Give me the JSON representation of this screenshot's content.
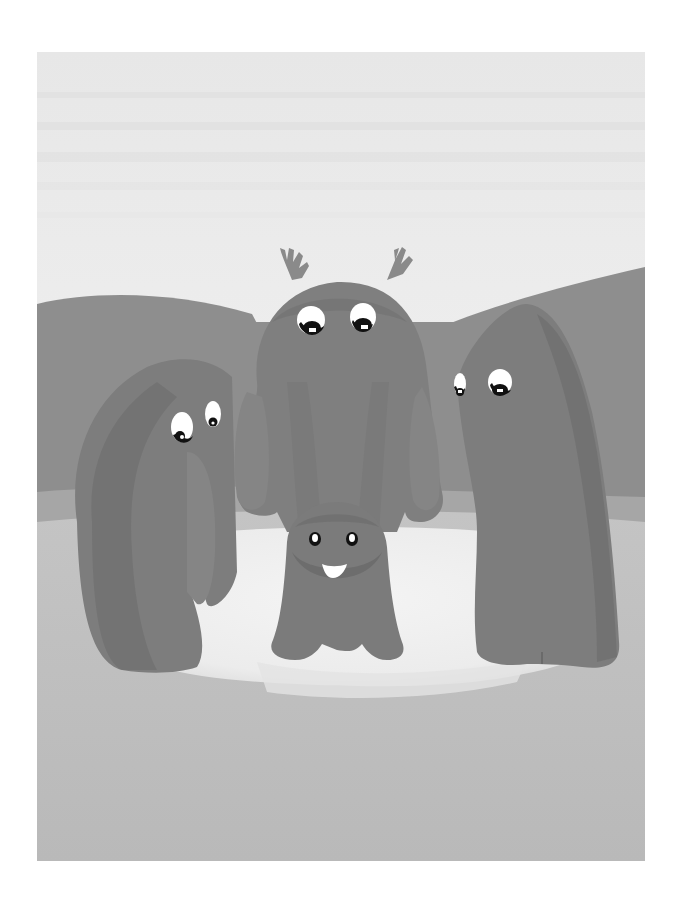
{
  "illustration": {
    "subject": "Four furry monster creatures standing around a pale pond in front of hills",
    "characters": [
      {
        "name": "left-creature",
        "pose": "leaning forward, looking down"
      },
      {
        "name": "tall-center-creature",
        "pose": "standing with antler-like tufts, looking down"
      },
      {
        "name": "right-creature",
        "pose": "leaning, looking down-left"
      },
      {
        "name": "small-smiling-creature",
        "pose": "standing in front, smiling"
      }
    ],
    "colors": {
      "sky": "#ececec",
      "sky_stripe": "#e2e2e2",
      "hills": "#8c8c8c",
      "creature": "#7e7e7e",
      "creature_shade": "#737373",
      "creature_light": "#8a8a8a",
      "pond": "#eeeeee",
      "ground": "#bdbdbd",
      "ground_mid": "#cacaca",
      "eye_white": "#ffffff",
      "pupil": "#111111"
    }
  }
}
